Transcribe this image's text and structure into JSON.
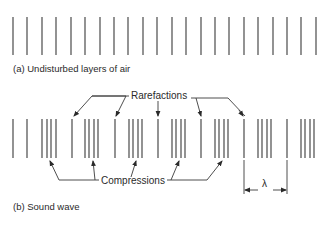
{
  "panel_a": {
    "caption": "(a) Undisturbed layers of air",
    "layer_positions": [
      13,
      27,
      42,
      56,
      71,
      85,
      100,
      114,
      128,
      143,
      157,
      172,
      186,
      201,
      215,
      229,
      244,
      258,
      273,
      287,
      301,
      316
    ],
    "y_top": 17,
    "y_bottom": 55
  },
  "panel_b": {
    "caption": "(b) Sound wave",
    "layer_positions": [
      13,
      27,
      42,
      47,
      51,
      56,
      72,
      85,
      89,
      94,
      98,
      115,
      129,
      133,
      138,
      142,
      158,
      172,
      176,
      181,
      185,
      201,
      215,
      219,
      224,
      228,
      244,
      258,
      262,
      267,
      271,
      287,
      301,
      305,
      310,
      314
    ],
    "y_top": 119,
    "y_bottom": 158,
    "rarefactions_label": "Rarefactions",
    "compressions_label": "Compressions",
    "wavelength_symbol": "λ",
    "wavelength_span": [
      244,
      287
    ]
  }
}
